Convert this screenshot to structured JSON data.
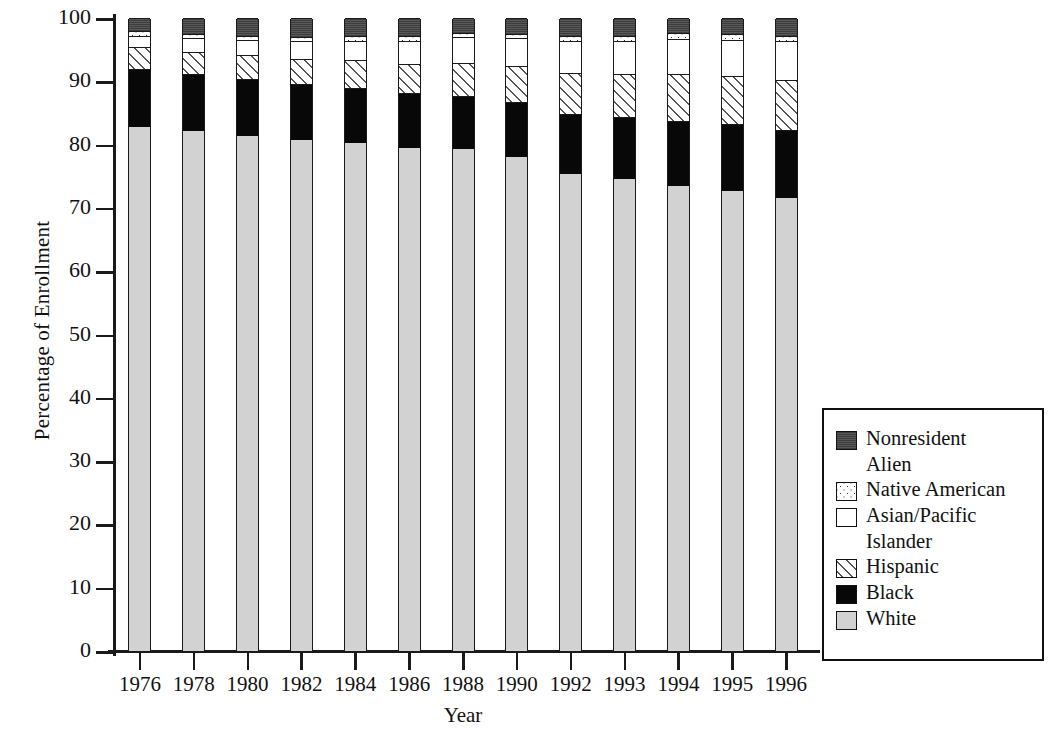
{
  "chart_data": {
    "type": "bar",
    "stacked": true,
    "title": "",
    "xlabel": "Year",
    "ylabel": "Percentage of Enrollment",
    "ylim": [
      0,
      100
    ],
    "yticks": [
      0,
      10,
      20,
      30,
      40,
      50,
      60,
      70,
      80,
      90,
      100
    ],
    "grid": false,
    "legend_position": "right",
    "categories": [
      "1976",
      "1978",
      "1980",
      "1982",
      "1984",
      "1986",
      "1988",
      "1990",
      "1992",
      "1993",
      "1994",
      "1995",
      "1996"
    ],
    "series": [
      {
        "name": "White",
        "swatch": "sw-white",
        "color": "#d2d2d2",
        "values": [
          82.8,
          82.1,
          81.4,
          80.7,
          80.2,
          79.5,
          79.3,
          78.0,
          75.3,
          74.6,
          73.4,
          72.7,
          71.5
        ]
      },
      {
        "name": "Black",
        "swatch": "sw-black",
        "color": "#080808",
        "values": [
          9.2,
          9.1,
          9.0,
          8.8,
          8.7,
          8.6,
          8.4,
          8.8,
          9.6,
          9.7,
          10.4,
          10.5,
          10.8
        ]
      },
      {
        "name": "Hispanic",
        "swatch": "sw-hisp",
        "color": "#ffffff",
        "values": [
          3.4,
          3.5,
          3.7,
          4.1,
          4.4,
          4.7,
          5.2,
          5.6,
          6.4,
          6.8,
          7.3,
          7.6,
          7.9
        ]
      },
      {
        "name": "Asian/Pacific Islander",
        "swatch": "sw-asian",
        "color": "#ffffff",
        "values": [
          1.8,
          2.1,
          2.4,
          2.7,
          3.1,
          3.6,
          4.1,
          4.4,
          5.1,
          5.3,
          5.6,
          5.8,
          6.1
        ]
      },
      {
        "name": "Native American",
        "swatch": "sw-native",
        "color": "#ffffff",
        "values": [
          0.7,
          0.7,
          0.7,
          0.7,
          0.7,
          0.7,
          0.7,
          0.7,
          0.8,
          0.8,
          0.9,
          0.9,
          0.9
        ]
      },
      {
        "name": "Nonresident Alien",
        "swatch": "sw-nonres",
        "color": "#4c4c4c",
        "values": [
          2.1,
          2.5,
          2.8,
          3.0,
          2.9,
          2.9,
          2.3,
          2.5,
          2.8,
          2.8,
          2.4,
          2.5,
          2.8
        ]
      }
    ]
  },
  "legend": {
    "entries": [
      {
        "label": "Nonresident",
        "label2": "Alien",
        "swatch": "sw-nonres"
      },
      {
        "label": "Native American",
        "label2": "",
        "swatch": "sw-native"
      },
      {
        "label": "Asian/Pacific",
        "label2": "Islander",
        "swatch": "sw-asian"
      },
      {
        "label": "Hispanic",
        "label2": "",
        "swatch": "sw-hisp"
      },
      {
        "label": "Black",
        "label2": "",
        "swatch": "sw-black"
      },
      {
        "label": "White",
        "label2": "",
        "swatch": "sw-white"
      }
    ]
  }
}
